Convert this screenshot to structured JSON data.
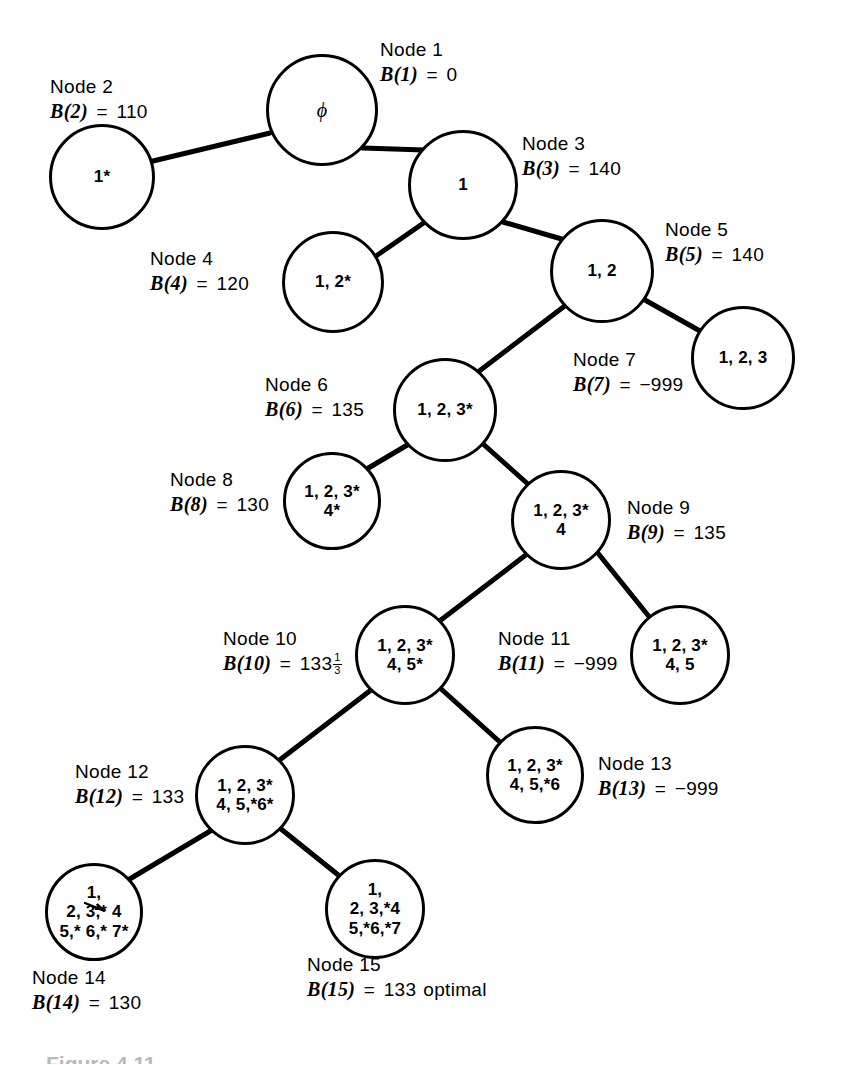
{
  "figure": {
    "caption": "Figure 4.11"
  },
  "style": {
    "stroke": "#000000",
    "background": "#ffffff"
  },
  "diagram": {
    "type": "branch-and-bound-tree",
    "nodes": [
      {
        "id": "n1",
        "number": "Node 1",
        "bound_label": "B(1)",
        "bound_value": "0",
        "content": [
          "ϕ"
        ],
        "cx": 322,
        "cy": 110,
        "r": 56,
        "label_x": 380,
        "label_y": 38
      },
      {
        "id": "n2",
        "number": "Node 2",
        "bound_label": "B(2)",
        "bound_value": "110",
        "content": [
          "1*"
        ],
        "cx": 102,
        "cy": 177,
        "r": 53,
        "label_x": 50,
        "label_y": 75
      },
      {
        "id": "n3",
        "number": "Node 3",
        "bound_label": "B(3)",
        "bound_value": "140",
        "content": [
          "1"
        ],
        "cx": 463,
        "cy": 185,
        "r": 55,
        "label_x": 522,
        "label_y": 132
      },
      {
        "id": "n4",
        "number": "Node 4",
        "bound_label": "B(4)",
        "bound_value": "120",
        "content": [
          "1, 2*"
        ],
        "cx": 333,
        "cy": 282,
        "r": 51,
        "label_x": 150,
        "label_y": 247
      },
      {
        "id": "n5",
        "number": "Node 5",
        "bound_label": "B(5)",
        "bound_value": "140",
        "content": [
          "1, 2"
        ],
        "cx": 602,
        "cy": 271,
        "r": 52,
        "label_x": 665,
        "label_y": 218
      },
      {
        "id": "n6",
        "number": "Node 6",
        "bound_label": "B(6)",
        "bound_value": "135",
        "content": [
          "1, 2, 3*"
        ],
        "cx": 445,
        "cy": 410,
        "r": 52,
        "label_x": 265,
        "label_y": 373
      },
      {
        "id": "n7",
        "number": "Node 7",
        "bound_label": "B(7)",
        "bound_value": "−999",
        "content": [
          "1, 2, 3"
        ],
        "cx": 743,
        "cy": 358,
        "r": 52,
        "label_x": 573,
        "label_y": 348
      },
      {
        "id": "n8",
        "number": "Node 8",
        "bound_label": "B(8)",
        "bound_value": "130",
        "content": [
          "1, 2, 3*",
          "4*"
        ],
        "cx": 332,
        "cy": 501,
        "r": 49,
        "label_x": 170,
        "label_y": 468
      },
      {
        "id": "n9",
        "number": "Node 9",
        "bound_label": "B(9)",
        "bound_value": "135",
        "content": [
          "1, 2, 3*",
          "4"
        ],
        "cx": 561,
        "cy": 520,
        "r": 50,
        "label_x": 627,
        "label_y": 496
      },
      {
        "id": "n10",
        "number": "Node 10",
        "bound_label": "B(10)",
        "bound_value": "133",
        "bound_fraction": {
          "num": "1",
          "den": "3"
        },
        "content": [
          "1, 2, 3*",
          "4, 5*"
        ],
        "cx": 405,
        "cy": 655,
        "r": 50,
        "label_x": 223,
        "label_y": 627
      },
      {
        "id": "n11",
        "number": "Node 11",
        "bound_label": "B(11)",
        "bound_value": "−999",
        "content": [
          "1, 2, 3*",
          "4, 5"
        ],
        "cx": 680,
        "cy": 655,
        "r": 50,
        "label_x": 498,
        "label_y": 627
      },
      {
        "id": "n12",
        "number": "Node 12",
        "bound_label": "B(12)",
        "bound_value": "133",
        "content": [
          "1, 2, 3*",
          "4, 5,*6*"
        ],
        "cx": 245,
        "cy": 795,
        "r": 50,
        "label_x": 75,
        "label_y": 760
      },
      {
        "id": "n13",
        "number": "Node 13",
        "bound_label": "B(13)",
        "bound_value": "−999",
        "content": [
          "1, 2, 3*",
          "4, 5,*6"
        ],
        "cx": 535,
        "cy": 775,
        "r": 49,
        "label_x": 598,
        "label_y": 752
      },
      {
        "id": "n14",
        "number": "Node 14",
        "bound_label": "B(14)",
        "bound_value": "130",
        "content": [
          "1,",
          "2, 3,* 4",
          "5,* 6,* 7*"
        ],
        "cx": 94,
        "cy": 912,
        "r": 49,
        "label_x": 32,
        "label_y": 966
      },
      {
        "id": "n15",
        "number": "Node 15",
        "bound_label": "B(15)",
        "bound_value": "133",
        "bound_suffix": "optimal",
        "content": [
          "1,",
          "2, 3,*4",
          "5,*6,*7"
        ],
        "cx": 375,
        "cy": 909,
        "r": 50,
        "label_x": 307,
        "label_y": 953
      }
    ],
    "edges": [
      {
        "from": "n1",
        "to": "n2",
        "x1": 270,
        "y1": 133,
        "x2": 153,
        "y2": 161
      },
      {
        "from": "n1",
        "to": "n3",
        "x1": 363,
        "y1": 148,
        "x2": 424,
        "y2": 150
      },
      {
        "from": "n3",
        "to": "n4",
        "x1": 425,
        "y1": 222,
        "x2": 376,
        "y2": 256
      },
      {
        "from": "n3",
        "to": "n5",
        "x1": 503,
        "y1": 222,
        "x2": 565,
        "y2": 240
      },
      {
        "from": "n5",
        "to": "n6",
        "x1": 566,
        "y1": 305,
        "x2": 478,
        "y2": 372
      },
      {
        "from": "n5",
        "to": "n7",
        "x1": 645,
        "y1": 300,
        "x2": 700,
        "y2": 331
      },
      {
        "from": "n6",
        "to": "n8",
        "x1": 409,
        "y1": 444,
        "x2": 365,
        "y2": 470
      },
      {
        "from": "n6",
        "to": "n9",
        "x1": 482,
        "y1": 443,
        "x2": 529,
        "y2": 485
      },
      {
        "from": "n9",
        "to": "n10",
        "x1": 527,
        "y1": 554,
        "x2": 437,
        "y2": 623
      },
      {
        "from": "n9",
        "to": "n11",
        "x1": 597,
        "y1": 552,
        "x2": 651,
        "y2": 619
      },
      {
        "from": "n10",
        "to": "n12",
        "x1": 371,
        "y1": 690,
        "x2": 277,
        "y2": 762
      },
      {
        "from": "n10",
        "to": "n13",
        "x1": 440,
        "y1": 688,
        "x2": 501,
        "y2": 743
      },
      {
        "from": "n12",
        "to": "n14",
        "x1": 212,
        "y1": 830,
        "x2": 128,
        "y2": 880
      },
      {
        "from": "n12",
        "to": "n15",
        "x1": 281,
        "y1": 829,
        "x2": 342,
        "y2": 878
      }
    ]
  }
}
